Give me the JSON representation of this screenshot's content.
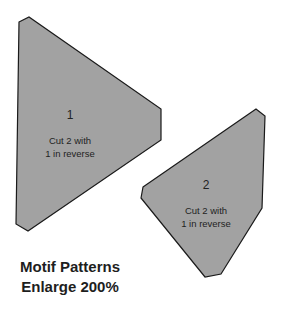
{
  "pieces": [
    {
      "number": "1",
      "note_line1": "Cut 2 with",
      "note_line2": "1 in reverse"
    },
    {
      "number": "2",
      "note_line1": "Cut 2 with",
      "note_line2": "1 in reverse"
    }
  ],
  "caption": {
    "line1": "Motif Patterns",
    "line2": "Enlarge 200%"
  },
  "colors": {
    "piece_fill": "#a2a2a2",
    "outline": "#1a1a1a",
    "background": "#ffffff"
  }
}
